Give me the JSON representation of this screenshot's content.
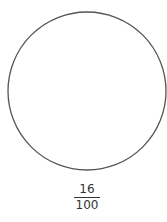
{
  "diagram": {
    "shape": "circle",
    "stroke_color": "#555555",
    "fraction": {
      "numerator": "16",
      "denominator": "100"
    }
  }
}
